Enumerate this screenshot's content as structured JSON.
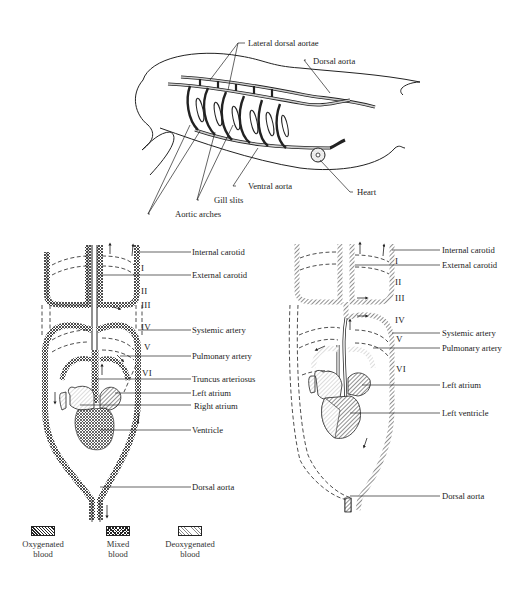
{
  "embryo_diagram": {
    "labels": {
      "lateral_dorsal_aortae": "Lateral dorsal aortae",
      "dorsal_aorta": "Dorsal aorta",
      "ventral_aorta": "Ventral aorta",
      "heart": "Heart",
      "gill_slits": "Gill slits",
      "aortic_arches": "Aortic arches"
    }
  },
  "left_diagram": {
    "arch_numerals": [
      "I",
      "II",
      "III",
      "IV",
      "V",
      "VI"
    ],
    "labels": {
      "internal_carotid": "Internal carotid",
      "external_carotid": "External carotid",
      "systemic_artery": "Systemic artery",
      "pulmonary_artery": "Pulmonary artery",
      "truncus_arteriosus": "Truncus arteriosus",
      "left_atrium": "Left atrium",
      "right_atrium": "Right atrium",
      "ventricle": "Ventricle",
      "dorsal_aorta": "Dorsal aorta"
    }
  },
  "right_diagram": {
    "arch_numerals": [
      "I",
      "II",
      "III",
      "IV",
      "V",
      "VI"
    ],
    "labels": {
      "internal_carotid": "Internal carotid",
      "external_carotid": "External carotid",
      "systemic_artery": "Systemic artery",
      "pulmonary_artery": "Pulmonary artery",
      "left_atrium": "Left atrium",
      "left_ventricle": "Left ventricle",
      "dorsal_aorta": "Dorsal aorta"
    }
  },
  "legend": {
    "items": [
      {
        "line1": "Oxygenated",
        "line2": "blood",
        "pattern": "diagonal-hatch"
      },
      {
        "line1": "Mixed",
        "line2": "blood",
        "pattern": "cross-hatch"
      },
      {
        "line1": "Deoxygenated",
        "line2": "blood",
        "pattern": "stipple"
      }
    ]
  }
}
